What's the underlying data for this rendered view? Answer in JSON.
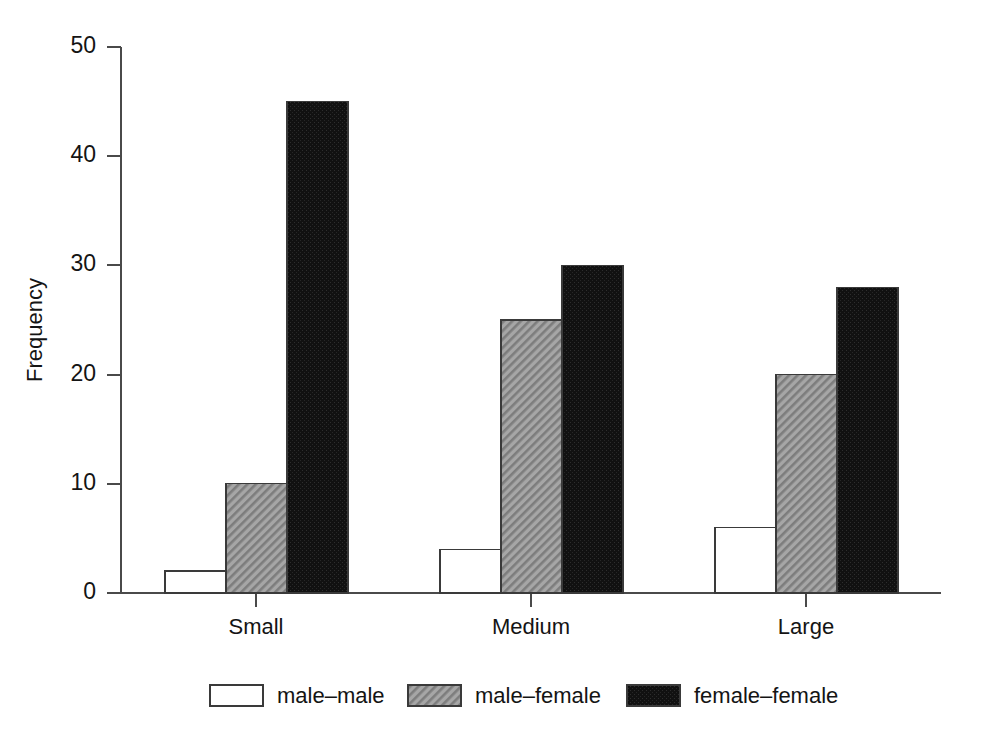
{
  "chart_data": {
    "type": "bar",
    "title": "",
    "xlabel": "",
    "ylabel": "Frequency",
    "categories": [
      "Small",
      "Medium",
      "Large"
    ],
    "series": [
      {
        "name": "male–male",
        "values": [
          2,
          4,
          6
        ],
        "fill": "white",
        "color": "#ffffff"
      },
      {
        "name": "male–female",
        "values": [
          10,
          25,
          20
        ],
        "fill": "hatch",
        "color": "#9a9a9a"
      },
      {
        "name": "female–female",
        "values": [
          45,
          30,
          28
        ],
        "fill": "solid",
        "color": "#0f0f0f"
      }
    ],
    "ylim": [
      0,
      50
    ],
    "yticks": [
      0,
      10,
      20,
      30,
      40,
      50
    ],
    "yticklabels": [
      "0",
      "10",
      "20",
      "30",
      "40",
      "50"
    ],
    "grid": false,
    "legend_position": "bottom",
    "axis_color": "#4a4a4a"
  },
  "legend": {
    "entries": [
      {
        "label": "male–male"
      },
      {
        "label": "male–female"
      },
      {
        "label": "female–female"
      }
    ]
  },
  "axes": {
    "y_title": "Frequency",
    "y_tick_labels": [
      "50",
      "40",
      "30",
      "20",
      "10",
      "0"
    ],
    "x_tick_labels": [
      "Small",
      "Medium",
      "Large"
    ]
  }
}
